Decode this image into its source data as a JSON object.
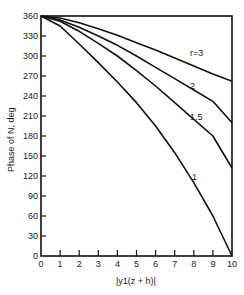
{
  "chart_data": {
    "type": "line",
    "title": "",
    "xlabel": "|y1(z + h)|",
    "ylabel": "Phase of N, deg",
    "xlim": [
      0,
      10
    ],
    "ylim": [
      0,
      360
    ],
    "xticks": [
      0,
      1,
      2,
      3,
      4,
      5,
      6,
      7,
      8,
      9,
      10
    ],
    "yticks": [
      0,
      30,
      60,
      90,
      120,
      150,
      180,
      210,
      240,
      270,
      300,
      330,
      360
    ],
    "grid": false,
    "legend": "inline labels",
    "x": [
      0,
      1,
      2,
      3,
      4,
      5,
      6,
      7,
      8,
      9,
      10
    ],
    "series": [
      {
        "name": "r = 3",
        "label": "r=3",
        "values": [
          360,
          357,
          350,
          341,
          331,
          320,
          309,
          297,
          285,
          273,
          262
        ]
      },
      {
        "name": "r = 2",
        "label": "2",
        "values": [
          360,
          354,
          343,
          330,
          316,
          300,
          283,
          266,
          249,
          232,
          200
        ]
      },
      {
        "name": "r = 1.5",
        "label": "1.5",
        "values": [
          360,
          352,
          337,
          319,
          300,
          278,
          255,
          230,
          205,
          180,
          132
        ]
      },
      {
        "name": "r = 1",
        "label": "1",
        "values": [
          360,
          345,
          318,
          290,
          261,
          230,
          195,
          155,
          110,
          60,
          0
        ]
      }
    ]
  }
}
